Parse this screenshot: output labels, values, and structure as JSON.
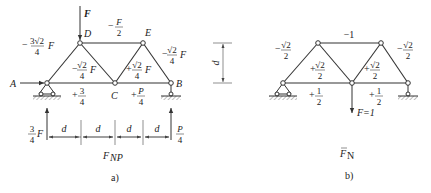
{
  "diagram_a": {
    "caption": "a)",
    "title_main": "F",
    "title_sub": "NP",
    "applied_load": "F",
    "nodes": {
      "A": "A",
      "B": "B",
      "C": "C",
      "D": "D",
      "E": "E"
    },
    "members": {
      "AD": {
        "sign": "−",
        "num": "3√2",
        "den": "4",
        "suffix": "F"
      },
      "DE": {
        "sign": "−",
        "num": "F",
        "den": "2"
      },
      "EB": {
        "sign": "−",
        "num": "√2",
        "den": "4",
        "suffix": "F"
      },
      "DC": {
        "sign": "−",
        "num": "√2",
        "den": "4",
        "suffix": "F"
      },
      "CE": {
        "sign": "+",
        "num": "√2",
        "den": "4",
        "suffix": "F"
      },
      "AC": {
        "sign": "+",
        "num": "3",
        "den": "4"
      },
      "CB": {
        "sign": "+",
        "num": "P",
        "den": "4"
      }
    },
    "reactions": {
      "left": {
        "num": "3",
        "den": "4",
        "suffix": "F"
      },
      "right": {
        "num": "P",
        "den": "4"
      }
    },
    "dimensions": [
      "d",
      "d",
      "d",
      "d"
    ]
  },
  "height_dimension": "d",
  "diagram_b": {
    "caption": "b)",
    "title_main": "F",
    "title_sub": "N",
    "unit_load": "F=1",
    "members": {
      "AD": {
        "sign": "−",
        "num": "√2",
        "den": "2"
      },
      "DE": {
        "value": "−1"
      },
      "EB": {
        "sign": "−",
        "num": "√2",
        "den": "2"
      },
      "DC": {
        "sign": "+",
        "num": "√2",
        "den": "2"
      },
      "CE": {
        "sign": "+",
        "num": "√2",
        "den": "2"
      },
      "AC": {
        "sign": "+",
        "num": "1",
        "den": "2"
      },
      "CB": {
        "sign": "+",
        "num": "1",
        "den": "2"
      }
    }
  }
}
